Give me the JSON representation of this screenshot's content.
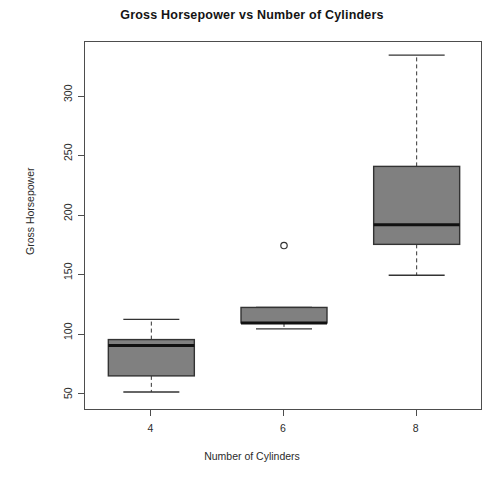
{
  "chart_data": {
    "type": "box",
    "title": "Gross Horsepower vs Number of Cylinders",
    "xlabel": "Number of Cylinders",
    "ylabel": "Gross Horsepower",
    "categories": [
      "4",
      "6",
      "8"
    ],
    "xtick_labels": [
      "4",
      "6",
      "8"
    ],
    "ytick_labels": [
      "50",
      "100",
      "150",
      "200",
      "250",
      "300"
    ],
    "yticks": [
      50,
      100,
      150,
      200,
      250,
      300
    ],
    "ylim": [
      36,
      346
    ],
    "grid": false,
    "legend": null,
    "box_fill": "#808080",
    "box_edge": "#333333",
    "whisker_style": "dashed",
    "boxes": [
      {
        "category": "4",
        "min": 52,
        "q1": 65.5,
        "median": 91,
        "q3": 96,
        "max": 113,
        "outliers": []
      },
      {
        "category": "6",
        "min": 105,
        "q1": 110,
        "median": 110,
        "q3": 123,
        "max": 123,
        "outliers": [
          175
        ]
      },
      {
        "category": "8",
        "min": 150,
        "q1": 176,
        "median": 192.5,
        "q3": 241.5,
        "max": 335,
        "outliers": []
      }
    ]
  }
}
